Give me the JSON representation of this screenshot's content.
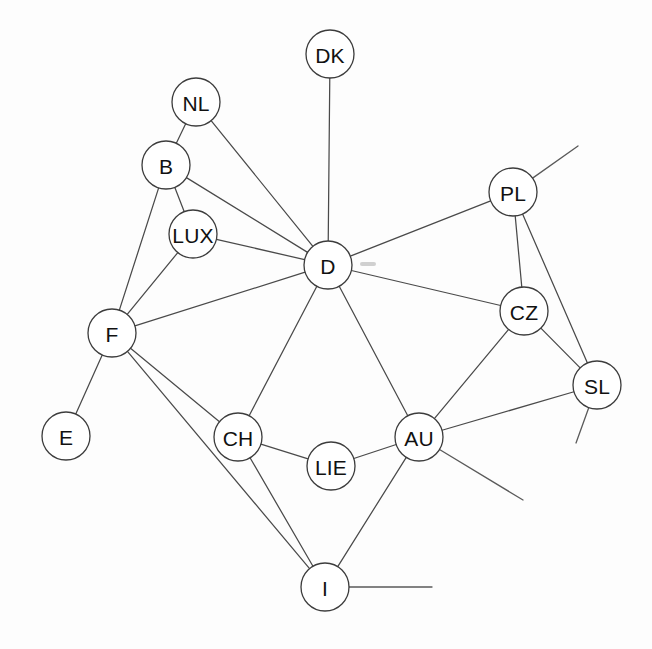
{
  "diagram": {
    "type": "node-link-graph",
    "background_color": "#fdfdfd",
    "node_fill_color": "#ffffff",
    "node_stroke_color": "#3c3c3c",
    "edge_color": "#4a4a4a",
    "label_color": "#111111",
    "node_radius": 24,
    "width": 652,
    "height": 649,
    "nodes": [
      {
        "id": "DK",
        "label": "DK",
        "x": 330,
        "y": 54
      },
      {
        "id": "NL",
        "label": "NL",
        "x": 196,
        "y": 102
      },
      {
        "id": "B",
        "label": "B",
        "x": 166,
        "y": 165
      },
      {
        "id": "PL",
        "label": "PL",
        "x": 513,
        "y": 192
      },
      {
        "id": "LUX",
        "label": "LUX",
        "x": 193,
        "y": 234
      },
      {
        "id": "D",
        "label": "D",
        "x": 328,
        "y": 265
      },
      {
        "id": "CZ",
        "label": "CZ",
        "x": 524,
        "y": 311
      },
      {
        "id": "F",
        "label": "F",
        "x": 112,
        "y": 333
      },
      {
        "id": "SL",
        "label": "SL",
        "x": 597,
        "y": 385
      },
      {
        "id": "E",
        "label": "E",
        "x": 66,
        "y": 436
      },
      {
        "id": "CH",
        "label": "CH",
        "x": 238,
        "y": 437
      },
      {
        "id": "AU",
        "label": "AU",
        "x": 419,
        "y": 437
      },
      {
        "id": "LIE",
        "label": "LIE",
        "x": 331,
        "y": 466
      },
      {
        "id": "I",
        "label": "I",
        "x": 325,
        "y": 587
      }
    ],
    "edges": [
      {
        "source": "DK",
        "target": "D"
      },
      {
        "source": "NL",
        "target": "B"
      },
      {
        "source": "NL",
        "target": "D"
      },
      {
        "source": "B",
        "target": "LUX"
      },
      {
        "source": "B",
        "target": "D"
      },
      {
        "source": "B",
        "target": "F"
      },
      {
        "source": "LUX",
        "target": "D"
      },
      {
        "source": "LUX",
        "target": "F"
      },
      {
        "source": "D",
        "target": "F"
      },
      {
        "source": "D",
        "target": "CH"
      },
      {
        "source": "D",
        "target": "AU"
      },
      {
        "source": "D",
        "target": "CZ"
      },
      {
        "source": "D",
        "target": "PL"
      },
      {
        "source": "PL",
        "target": "CZ"
      },
      {
        "source": "PL",
        "target": "SL"
      },
      {
        "source": "CZ",
        "target": "SL"
      },
      {
        "source": "CZ",
        "target": "AU"
      },
      {
        "source": "F",
        "target": "E"
      },
      {
        "source": "F",
        "target": "CH"
      },
      {
        "source": "F",
        "target": "I"
      },
      {
        "source": "CH",
        "target": "LIE"
      },
      {
        "source": "CH",
        "target": "I"
      },
      {
        "source": "LIE",
        "target": "AU"
      },
      {
        "source": "AU",
        "target": "SL"
      },
      {
        "source": "AU",
        "target": "I"
      }
    ],
    "free_edges": [
      {
        "source": "PL",
        "end_x": 578,
        "end_y": 146,
        "name": "pl-free-edge"
      },
      {
        "source": "SL",
        "end_x": 576,
        "end_y": 443,
        "name": "sl-free-edge"
      },
      {
        "source": "AU",
        "end_x": 523,
        "end_y": 500,
        "name": "au-free-edge"
      },
      {
        "source": "I",
        "end_x": 432,
        "end_y": 587,
        "name": "i-free-edge"
      }
    ],
    "artifact": {
      "x": 360,
      "y": 262,
      "width": 16,
      "height": 4
    }
  }
}
